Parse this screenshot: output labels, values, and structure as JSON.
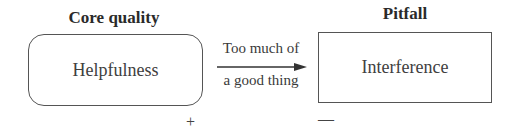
{
  "diagram": {
    "left": {
      "heading": "Core quality",
      "box_label": "Helpfulness",
      "shape": "rounded-rectangle",
      "sign": "+"
    },
    "right": {
      "heading": "Pitfall",
      "box_label": "Interference",
      "shape": "rectangle",
      "sign": "—"
    },
    "connector": {
      "label_top": "Too much of",
      "label_bottom": "a good thing",
      "direction": "left-to-right",
      "icon": "arrow-right-icon"
    }
  }
}
